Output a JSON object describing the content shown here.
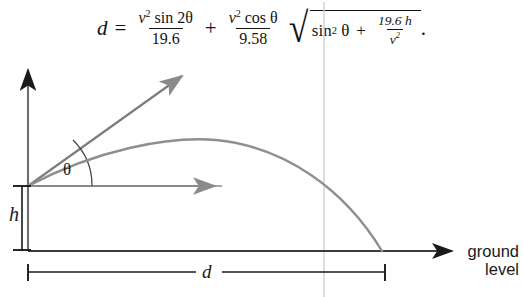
{
  "figure": {
    "kind": "projectile-motion-diagram",
    "background_color": "#ffffff",
    "ink_color": "#1a1a1a",
    "curve_color": "#8a8a8a",
    "guide_color": "#cccccc"
  },
  "formula": {
    "lhs": "d",
    "equals": "=",
    "term1": {
      "numerator_var": "v",
      "numerator_power": "2",
      "numerator_func": "sin 2",
      "numerator_angle": "θ",
      "denominator": "19.6"
    },
    "plus_1": "+",
    "term2": {
      "numerator_var": "v",
      "numerator_power": "2",
      "numerator_func": "cos ",
      "numerator_angle": "θ",
      "denominator": "9.58"
    },
    "radical": {
      "sign": "√",
      "func": "sin",
      "power": "2",
      "angle": "θ",
      "plus": "+",
      "frac_numerator": "19.6 h",
      "frac_denominator_var": "v",
      "frac_denominator_power": "2"
    },
    "period": "."
  },
  "diagram": {
    "labels": {
      "angle": "θ",
      "height": "h",
      "distance": "d",
      "ground_line1": "ground",
      "ground_line2": "level"
    },
    "geometry": {
      "launch_point": [
        28,
        186
      ],
      "y_axis_x": 28,
      "y_axis_top": 66,
      "ground_y": 251,
      "ground_arrow_tip_x": 455,
      "landing_point_x": 382,
      "velocity_arrow_tip": [
        186,
        72
      ],
      "horizontal_arrow_tip": [
        222,
        186
      ],
      "trajectory_apex": [
        216,
        140
      ],
      "h_bracket_x": 22,
      "d_bracket_y": 272,
      "guide_line_x": 324
    }
  }
}
